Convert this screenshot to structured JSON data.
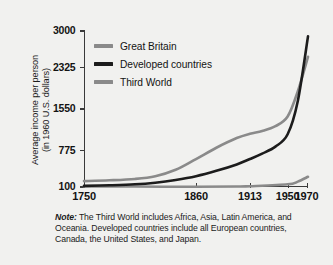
{
  "chart_data": {
    "type": "line",
    "title": "",
    "subtitle": "",
    "xlabel": "",
    "ylabel_line1": "Average income per person",
    "ylabel_line2": "(in 1960 U.S. dollars)",
    "xtick_labels": [
      "1750",
      "1860",
      "1913",
      "1950",
      "1970"
    ],
    "xtick_values": [
      1750,
      1860,
      1913,
      1950,
      1970
    ],
    "ytick_labels": [
      "100",
      "775",
      "1550",
      "2325",
      "3000"
    ],
    "ytick_values": [
      100,
      775,
      1550,
      2325,
      3000
    ],
    "xlim": [
      1750,
      1970
    ],
    "ylim": [
      100,
      3000
    ],
    "grid": false,
    "legend_position": "upper-left-inside",
    "series": [
      {
        "name": "Great Britain",
        "color": "#8a8a8a",
        "x": [
          1750,
          1775,
          1800,
          1820,
          1840,
          1860,
          1880,
          1900,
          1913,
          1925,
          1938,
          1950,
          1960,
          1970
        ],
        "values": [
          210,
          225,
          250,
          300,
          420,
          620,
          830,
          1010,
          1090,
          1140,
          1230,
          1410,
          1880,
          2520
        ]
      },
      {
        "name": "Developed countries",
        "color": "#1c1c1c",
        "x": [
          1750,
          1775,
          1800,
          1820,
          1840,
          1860,
          1880,
          1900,
          1913,
          1925,
          1938,
          1950,
          1960,
          1970
        ],
        "values": [
          120,
          132,
          150,
          180,
          230,
          300,
          400,
          520,
          620,
          720,
          850,
          1080,
          1700,
          2900
        ]
      },
      {
        "name": "Third World",
        "color": "#8a8a8a",
        "x": [
          1750,
          1800,
          1860,
          1900,
          1913,
          1950,
          1960,
          1970
        ],
        "values": [
          112,
          108,
          104,
          108,
          115,
          150,
          200,
          290
        ]
      }
    ],
    "note_label": "Note:",
    "note_text": "The Third World includes Africa, Asia, Latin America, and Oceania. Developed countries include all European countries, Canada, the United States, and Japan.",
    "colors": {
      "background": "#f1f1ef",
      "axis": "#3a3a3a",
      "text": "#131313",
      "gray_series": "#8a8a8a",
      "dark_series": "#1c1c1c"
    }
  }
}
